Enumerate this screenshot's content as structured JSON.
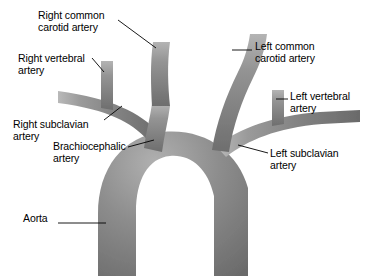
{
  "diagram": {
    "vessel_color": "#8a8a8a",
    "vessel_highlight_color": "#c9c9c9",
    "vessel_shadow_color": "#5e5e5e",
    "background_color": "#ffffff",
    "leader_line_color": "#000000",
    "label_text_color": "#000000"
  },
  "labels": {
    "right_common_carotid": "Right common\ncarotid artery",
    "right_vertebral": "Right vertebral\nartery",
    "right_subclavian": "Right subclavian\nartery",
    "brachiocephalic": "Brachiocephalic\nartery",
    "aorta": "Aorta",
    "left_common_carotid": "Left common\ncarotid artery",
    "left_vertebral": "Left vertebral\nartery",
    "left_subclavian": "Left subclavian\nartery"
  }
}
